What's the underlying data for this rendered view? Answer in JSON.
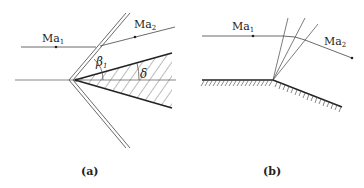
{
  "figure": {
    "panels": [
      {
        "id": "a",
        "caption": "(a)",
        "description": "Oblique shock at a wedge",
        "labels": {
          "upstream_mach": "Ma",
          "upstream_mach_sub": "1",
          "downstream_mach": "Ma",
          "downstream_mach_sub": "2",
          "shock_angle": "β",
          "shock_angle_sub": "1",
          "deflection_angle": "δ"
        }
      },
      {
        "id": "b",
        "caption": "(b)",
        "description": "Prandtl–Meyer expansion around a convex corner",
        "labels": {
          "upstream_mach": "Ma",
          "upstream_mach_sub": "1",
          "downstream_mach": "Ma",
          "downstream_mach_sub": "2"
        }
      }
    ],
    "colors": {
      "line": "#333333",
      "thin_line": "#555555",
      "background": "#ffffff"
    }
  }
}
